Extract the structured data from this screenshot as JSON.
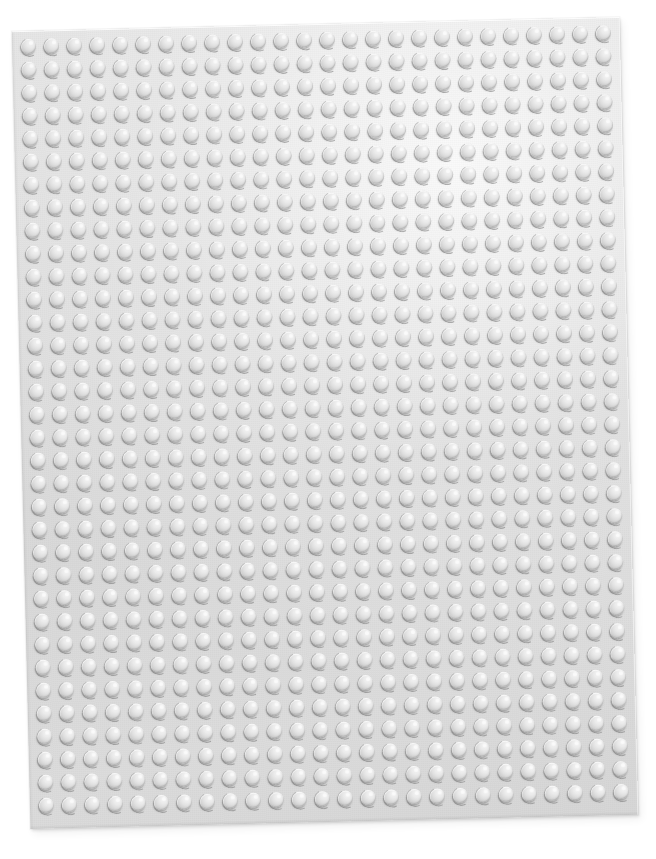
{
  "scene": {
    "subject": "LEGO baseplate",
    "description": "Overhead photograph of a light gray LEGO baseplate lying on a plain white background",
    "background_color": "#ffffff",
    "capture_note": "plate slightly rotated counter-clockwise within the frame"
  },
  "baseplate": {
    "label": "LEGO baseplate",
    "color_name": "light gray",
    "plate_color": "#dcdcdc",
    "stud_top_color": "#ebebeb",
    "stud_highlight_color": "#f3f3f3",
    "stud_shadow_color": "#787878",
    "edge_highlight_color": "#ffffff",
    "rotation_degrees": -1.35,
    "position": {
      "left": 21,
      "top": 24,
      "width": 608,
      "height": 798
    },
    "border_margin_px": 8,
    "grid": {
      "columns": 26,
      "rows": 34,
      "stud_pitch_px": 23,
      "stud_diameter_px": 15,
      "stud_count": 884
    },
    "lighting": {
      "direction": "upper-right",
      "shadow_direction": "lower-left"
    }
  }
}
